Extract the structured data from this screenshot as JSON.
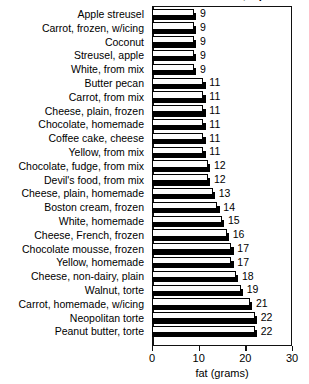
{
  "chart_data": {
    "type": "bar",
    "orientation": "horizontal",
    "title": "Sweets: CAKES, 1 piece",
    "xlabel": "fat (grams)",
    "ylabel": "",
    "xlim": [
      0,
      30
    ],
    "xticks": [
      0,
      10,
      20,
      30
    ],
    "xtick_labels": [
      "0",
      "10",
      "20",
      "30"
    ],
    "grid": false,
    "legend": false,
    "categories": [
      "Apple streusel",
      "Carrot, frozen, w/icing",
      "Coconut",
      "Streusel, apple",
      "White, from mix",
      "Butter pecan",
      "Carrot, from mix",
      "Cheese, plain, frozen",
      "Chocolate, homemade",
      "Coffee cake, cheese",
      "Yellow, from mix",
      "Chocolate, fudge, from mix",
      "Devil's food, from mix",
      "Cheese, plain, homemade",
      "Boston cream, frozen",
      "White, homemade",
      "Cheese, French, frozen",
      "Chocolate mousse, frozen",
      "Yellow, homemade",
      "Cheese, non-dairy, plain",
      "Walnut, torte",
      "Carrot, homemade, w/icing",
      "Neopolitan torte",
      "Peanut butter, torte"
    ],
    "values": [
      9,
      9,
      9,
      9,
      9,
      11,
      11,
      11,
      11,
      11,
      11,
      12,
      12,
      13,
      14,
      15,
      16,
      17,
      17,
      18,
      19,
      21,
      22,
      22
    ],
    "value_labels": [
      "9",
      "9",
      "9",
      "9",
      "9",
      "11",
      "11",
      "11",
      "11",
      "11",
      "11",
      "12",
      "12",
      "13",
      "14",
      "15",
      "16",
      "17",
      "17",
      "18",
      "19",
      "21",
      "22",
      "22"
    ],
    "colors": {
      "bar_face": "#fdfdfd",
      "bar_outline": "#000000",
      "bar_shadow": "#000000",
      "axis": "#111111",
      "text": "#000000",
      "background": "#ffffff"
    }
  }
}
